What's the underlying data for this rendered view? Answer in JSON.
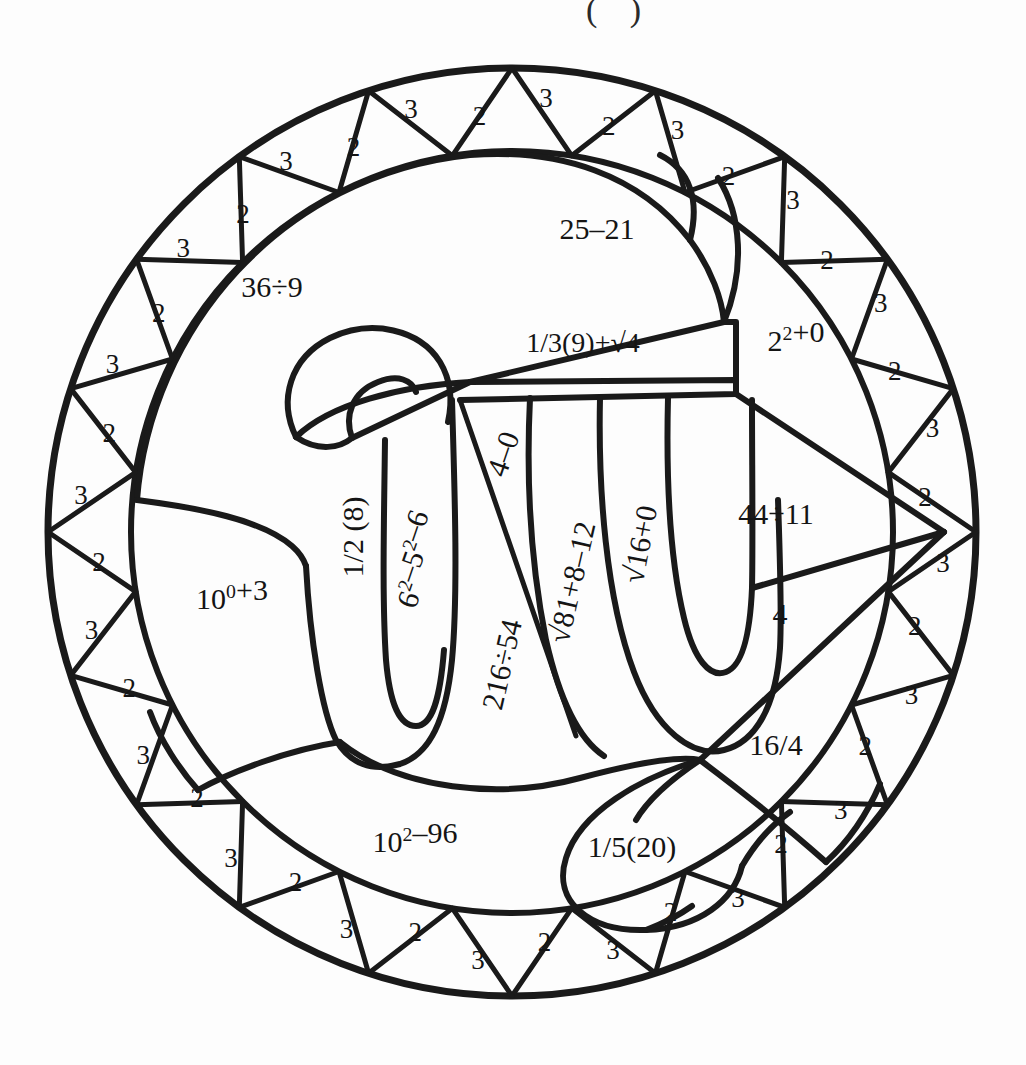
{
  "page": {
    "background_color": "#fdfdfd",
    "ink_color": "#1a1a1a",
    "top_partial_mark": "( )"
  },
  "geometry": {
    "center_x": 512,
    "center_y": 532,
    "outer_radius": 464,
    "ring_inner_radius": 381,
    "ring_segment_count": 40
  },
  "ring": {
    "label": "decorative border ring of alternating numbered triangles",
    "values": [
      "3",
      "2",
      "3",
      "2",
      "3",
      "2",
      "3",
      "2",
      "3",
      "2",
      "3",
      "2",
      "3",
      "2",
      "3",
      "2",
      "3",
      "2",
      "3",
      "2",
      "3",
      "2",
      "3",
      "2",
      "3",
      "2",
      "3",
      "2",
      "3",
      "2",
      "3",
      "2",
      "3",
      "2",
      "3",
      "2",
      "3",
      "2",
      "3",
      "2"
    ]
  },
  "regions": [
    {
      "id": "r-36div9",
      "name": "region-36-divided-by-9",
      "expr": "36÷9",
      "answer": "4",
      "x": 272,
      "y": 290,
      "rotate": 0
    },
    {
      "id": "r-25minus21",
      "name": "region-25-minus-21",
      "expr": "25–21",
      "answer": "4",
      "x": 597,
      "y": 232,
      "rotate": 0
    },
    {
      "id": "r-third9sqrt4",
      "name": "region-one-third-nine-plus-sqrt-four",
      "expr": "1/3(9)+√4",
      "answer": "5",
      "x": 583,
      "y": 346,
      "rotate": 0
    },
    {
      "id": "r-2sq0",
      "name": "region-two-squared-plus-zero",
      "expr": "2²+0",
      "answer": "4",
      "x": 796,
      "y": 344,
      "rotate": 0
    },
    {
      "id": "r-10pow0p3",
      "name": "region-ten-to-zero-plus-three",
      "expr": "10⁰+3",
      "answer": "4",
      "x": 232,
      "y": 602,
      "rotate": 0
    },
    {
      "id": "r-half8",
      "name": "region-one-half-of-eight",
      "expr": "1/2 (8)",
      "answer": "4",
      "x": 356,
      "y": 537,
      "rotate": -90
    },
    {
      "id": "r-6sq5sq6",
      "name": "region-six-squared-minus-five-squared-minus-six",
      "expr": "6²–5²–6",
      "answer": "5",
      "x": 424,
      "y": 563,
      "rotate": -71
    },
    {
      "id": "r-4minus0",
      "name": "region-four-minus-zero",
      "expr": "4–0",
      "answer": "4",
      "x": 506,
      "y": 455,
      "rotate": -71
    },
    {
      "id": "r-216div54",
      "name": "region-216-divided-by-54",
      "expr": "216÷54",
      "answer": "4",
      "x": 505,
      "y": 665,
      "rotate": -77
    },
    {
      "id": "r-sqrt81p8m12",
      "name": "region-sqrt-81-plus-8-minus-12",
      "expr": "√81+8–12",
      "answer": "5",
      "x": 575,
      "y": 583,
      "rotate": -77
    },
    {
      "id": "r-sqrt16p0",
      "name": "region-sqrt-16-plus-zero",
      "expr": "√16+0",
      "answer": "4",
      "x": 643,
      "y": 545,
      "rotate": -79
    },
    {
      "id": "r-44div11",
      "name": "region-44-divided-by-11",
      "expr": "44÷11",
      "answer": "4",
      "x": 776,
      "y": 517,
      "rotate": 0
    },
    {
      "id": "r-4",
      "name": "region-four",
      "expr": "4",
      "answer": "4",
      "x": 780,
      "y": 617,
      "rotate": 0
    },
    {
      "id": "r-16over4",
      "name": "region-sixteen-over-four",
      "expr": "16/4",
      "answer": "4",
      "x": 776,
      "y": 748,
      "rotate": 0
    },
    {
      "id": "r-10sq96",
      "name": "region-ten-squared-minus-96",
      "expr": "10²–96",
      "answer": "4",
      "x": 415,
      "y": 845,
      "rotate": 0
    },
    {
      "id": "r-fifth20",
      "name": "region-one-fifth-of-twenty",
      "expr": "1/5(20)",
      "answer": "4",
      "x": 632,
      "y": 850,
      "rotate": 0
    }
  ]
}
